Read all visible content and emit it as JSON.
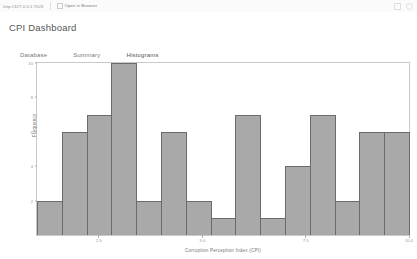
{
  "topbar": {
    "url": "http://127.0.0.1:7023",
    "open_button": "Open in Browser",
    "icon": "external-link-icon"
  },
  "page": {
    "title": "CPI Dashboard"
  },
  "tabs": [
    {
      "label": "Database",
      "active": false
    },
    {
      "label": "Summary",
      "active": false
    },
    {
      "label": "Histograms",
      "active": true
    }
  ],
  "colors": {
    "bar_fill": "#a9a9a9",
    "bar_edge": "#6b6b6b",
    "frame": "#c9c9c9",
    "text": "#777777",
    "background": "#ffffff"
  },
  "chart_data": {
    "type": "bar",
    "title": "",
    "xlabel": "Corruption Perception Index (CPI)",
    "ylabel": "Frequency",
    "grid": false,
    "legend": null,
    "xlim": [
      1.0,
      10.0
    ],
    "ylim": [
      0,
      10
    ],
    "xticks": [
      2.5,
      5.0,
      7.5,
      10.0
    ],
    "xticklabels": [
      "2.5",
      "5.0",
      "7.5",
      "10.0"
    ],
    "yticks": [
      2,
      4,
      6,
      8,
      10
    ],
    "yticklabels": [
      "2",
      "4",
      "6",
      "8",
      "10"
    ],
    "bin_edges": [
      1.0,
      1.6,
      2.2,
      2.8,
      3.4,
      4.0,
      4.6,
      5.2,
      5.8,
      6.4,
      7.0,
      7.6,
      8.2,
      8.8,
      9.4,
      10.0
    ],
    "categories": [
      "1.0-1.6",
      "1.6-2.2",
      "2.2-2.8",
      "2.8-3.4",
      "3.4-4.0",
      "4.0-4.6",
      "4.6-5.2",
      "5.2-5.8",
      "5.8-6.4",
      "6.4-7.0",
      "7.0-7.6",
      "7.6-8.2",
      "8.2-8.8",
      "8.8-9.4",
      "9.4-10.0"
    ],
    "values": [
      2,
      6,
      7,
      10,
      2,
      6,
      2,
      1,
      7,
      1,
      4,
      7,
      2,
      6,
      6
    ]
  }
}
